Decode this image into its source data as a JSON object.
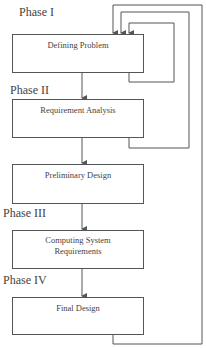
{
  "phases": [
    {
      "label": "Phase I"
    },
    {
      "label": "Phase II"
    },
    {
      "label": "Phase III"
    },
    {
      "label": "Phase IV"
    }
  ],
  "boxes": [
    {
      "label": "Defining Problem"
    },
    {
      "label": "Requirement Analysis"
    },
    {
      "label": "Preliminary Design"
    },
    {
      "label": "Computing System Requirements",
      "line1": "Computing System",
      "line2": "Requirements"
    },
    {
      "label": "Final Design"
    }
  ],
  "colors": {
    "line": "#555555",
    "text": "#444444",
    "background": "#ffffff"
  }
}
